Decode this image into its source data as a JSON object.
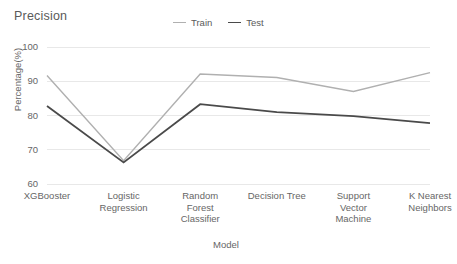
{
  "chart_data": {
    "type": "line",
    "title": "Precision",
    "xlabel": "Model",
    "ylabel": "Percentage(%)",
    "categories": [
      "XGBooster",
      "Logistic Regression",
      "Random Forest Classifier",
      "Decision Tree",
      "Support Vector Machine",
      "K Nearest Neighbors"
    ],
    "category_lines": [
      [
        "XGBooster"
      ],
      [
        "Logistic",
        "Regression"
      ],
      [
        "Random",
        "Forest",
        "Classifier"
      ],
      [
        "Decision Tree"
      ],
      [
        "Support",
        "Vector",
        "Machine"
      ],
      [
        "K Nearest",
        "Neighbors"
      ]
    ],
    "series": [
      {
        "name": "Train",
        "color": "#b0b0b0",
        "values": [
          91.7,
          66.8,
          92.1,
          91.1,
          87.0,
          92.5
        ]
      },
      {
        "name": "Test",
        "color": "#4a4a4a",
        "values": [
          82.8,
          66.3,
          83.3,
          81.0,
          79.8,
          77.8
        ]
      }
    ],
    "ylim": [
      60,
      100
    ],
    "yticks": [
      100,
      90,
      80,
      70,
      60
    ],
    "ytick_labels": [
      "100",
      "90",
      "80",
      "70",
      "60"
    ],
    "grid": true,
    "legend_position": "top-center"
  }
}
